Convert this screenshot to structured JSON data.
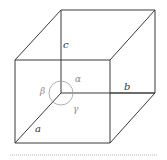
{
  "diagram": {
    "type": "parallelepiped",
    "edge_labels": {
      "a": "a",
      "b": "b",
      "c": "c"
    },
    "angle_labels": {
      "alpha": "α",
      "beta": "β",
      "gamma": "γ"
    },
    "colors": {
      "edge": "#3a3a3a",
      "angle_marker": "#9a9a9a",
      "separator": "#b5b5b5"
    }
  }
}
